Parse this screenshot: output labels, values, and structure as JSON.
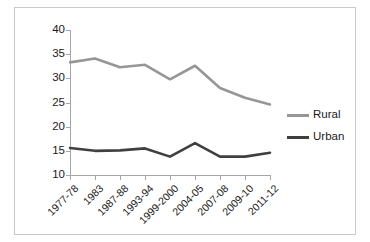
{
  "chart_data": {
    "type": "line",
    "title": "",
    "subtitle": "",
    "xlabel": "",
    "ylabel": "",
    "categories": [
      "1977-78",
      "1983",
      "1987-88",
      "1993-94",
      "1999-2000",
      "2004-05",
      "2007-08",
      "2009-10",
      "2011-12"
    ],
    "series": [
      {
        "name": "Rural",
        "color": "#969696",
        "values": [
          33.3,
          34.1,
          32.3,
          32.8,
          29.8,
          32.6,
          28.0,
          26.0,
          24.6
        ]
      },
      {
        "name": "Urban",
        "color": "#404040",
        "values": [
          15.6,
          15.0,
          15.1,
          15.5,
          13.8,
          16.6,
          13.8,
          13.8,
          14.6
        ]
      }
    ],
    "ylim": [
      10,
      40
    ],
    "yticks": [
      10,
      15,
      20,
      25,
      30,
      35,
      40
    ],
    "ytick_labels": [
      "10",
      "15",
      "20",
      "25",
      "30",
      "35",
      "40"
    ],
    "grid": false,
    "legend_position": "right",
    "legend_entries": [
      "Rural",
      "Urban"
    ],
    "xtick_rotation": -45,
    "annotations": []
  },
  "legend": {
    "items": [
      {
        "label": "Rural",
        "color": "#969696"
      },
      {
        "label": "Urban",
        "color": "#404040"
      }
    ]
  },
  "axes": {
    "y_tick_labels": [
      "40",
      "35",
      "30",
      "25",
      "20",
      "15",
      "10"
    ],
    "x_tick_labels": [
      "1977-78",
      "1983",
      "1987-88",
      "1993-94",
      "1999-2000",
      "2004-05",
      "2007-08",
      "2009-10",
      "2011-12"
    ]
  },
  "colors": {
    "rural_line": "#969696",
    "urban_line": "#404040",
    "axis": "#a6a6a6",
    "frame": "#c9c9c9",
    "text": "#1a1a1a",
    "background": "#ffffff"
  }
}
